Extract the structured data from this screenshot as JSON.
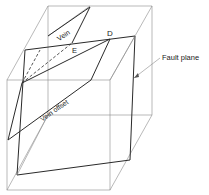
{
  "diagram": {
    "type": "block-diagram",
    "labels": {
      "vein": "Vein",
      "vein_offset": "Vein offset",
      "point_e": "E",
      "point_d": "D",
      "fault_plane": "Fault plane"
    },
    "colors": {
      "line_dark": "#2a2a2a",
      "line_light": "#8a8a8a",
      "background": "#ffffff"
    }
  }
}
